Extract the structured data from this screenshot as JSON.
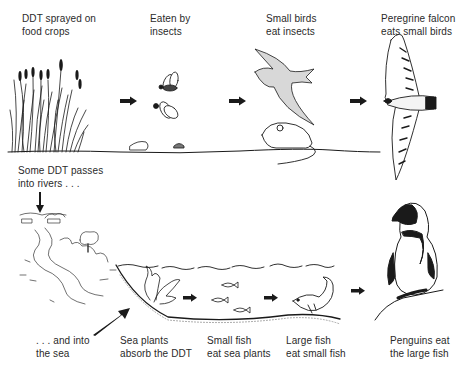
{
  "diagram": {
    "colors": {
      "ink": "#1a1a1a",
      "text": "#2a2a2a",
      "background": "#ffffff"
    },
    "top_row": [
      {
        "id": "crops",
        "line1": "DDT sprayed on",
        "line2": "food crops"
      },
      {
        "id": "insects",
        "line1": "Eaten by",
        "line2": "insects"
      },
      {
        "id": "small-birds",
        "line1": "Small birds",
        "line2": "eat insects"
      },
      {
        "id": "falcon",
        "line1": "Peregrine falcon",
        "line2": "eats small birds"
      }
    ],
    "rivers": {
      "line1": "Some DDT passes",
      "line2": "into rivers . . ."
    },
    "bottom_row": [
      {
        "id": "sea",
        "line1": ". . . and into",
        "line2": "the sea"
      },
      {
        "id": "sea-plants",
        "line1": "Sea plants",
        "line2": "absorb the DDT"
      },
      {
        "id": "small-fish",
        "line1": "Small fish",
        "line2": "eat sea plants"
      },
      {
        "id": "large-fish",
        "line1": "Large fish",
        "line2": "eat small fish"
      },
      {
        "id": "penguins",
        "line1": "Penguins eat",
        "line2": "the large fish"
      }
    ]
  }
}
